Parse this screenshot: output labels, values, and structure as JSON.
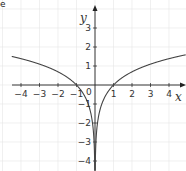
{
  "corner_mark": "e",
  "chart_data": {
    "type": "line",
    "title": "",
    "function": "y = ln|x|",
    "xlabel": "x",
    "ylabel": "y",
    "xlim": [
      -4.5,
      4.9
    ],
    "ylim": [
      -4.5,
      3.8
    ],
    "grid": true,
    "origin_label": "0",
    "x_ticks": [
      -4,
      -3,
      -2,
      -1,
      1,
      2,
      3,
      4
    ],
    "x_tick_labels": [
      "-4",
      "-3",
      "-2",
      "-1",
      "1",
      "2",
      "3",
      "4"
    ],
    "y_ticks": [
      3,
      2,
      1,
      -1,
      -2,
      -3,
      -4
    ],
    "y_tick_labels": [
      "3",
      "2",
      "1",
      "-1",
      "-2",
      "-3",
      "-4"
    ],
    "series": [
      {
        "name": "ln|x| (x<0)",
        "x": [
          -4.5,
          -4,
          -3,
          -2,
          -1.5,
          -1,
          -0.7,
          -0.5,
          -0.3,
          -0.2,
          -0.1,
          -0.05,
          -0.02
        ],
        "y": [
          1.5,
          1.39,
          1.1,
          0.69,
          0.41,
          0,
          -0.36,
          -0.69,
          -1.2,
          -1.61,
          -2.3,
          -3.0,
          -3.91
        ]
      },
      {
        "name": "ln|x| (x>0)",
        "x": [
          0.02,
          0.05,
          0.1,
          0.2,
          0.3,
          0.5,
          0.7,
          1,
          1.5,
          2,
          3,
          4,
          4.9
        ],
        "y": [
          -3.91,
          -3.0,
          -2.3,
          -1.61,
          -1.2,
          -0.69,
          -0.36,
          0,
          0.41,
          0.69,
          1.1,
          1.39,
          1.59
        ]
      }
    ],
    "colors": {
      "curve": "#444444",
      "axis": "#222222",
      "grid": "#e6e6e6",
      "text": "#333333"
    }
  }
}
